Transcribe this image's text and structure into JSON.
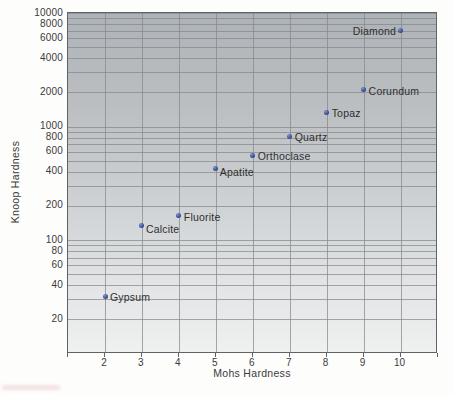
{
  "chart_data": {
    "type": "scatter",
    "title": "",
    "xlabel": "Mohs Hardness",
    "ylabel": "Knoop Hardness",
    "x_scale": "linear",
    "y_scale": "log",
    "xlim": [
      1,
      11
    ],
    "ylim": [
      10,
      10000
    ],
    "x_ticks": [
      2,
      3,
      4,
      5,
      6,
      7,
      8,
      9,
      10
    ],
    "y_tick_labels": [
      "10000",
      "8000",
      "6000",
      "4000",
      "2000",
      "1000",
      "800",
      "600",
      "400",
      "200",
      "100",
      "80",
      "60",
      "40",
      "20"
    ],
    "y_tick_values": [
      10000,
      8000,
      6000,
      4000,
      2000,
      1000,
      800,
      600,
      400,
      200,
      100,
      80,
      60,
      40,
      20
    ],
    "grid": "full log minor grid, vertical line each integer",
    "legend": "none",
    "points": [
      {
        "label": "Gypsum",
        "mohs": 2,
        "knoop": 32,
        "label_side": "right"
      },
      {
        "label": "Calcite",
        "mohs": 3,
        "knoop": 135,
        "label_side": "below-right"
      },
      {
        "label": "Fluorite",
        "mohs": 4,
        "knoop": 163,
        "label_side": "right"
      },
      {
        "label": "Apatite",
        "mohs": 5,
        "knoop": 430,
        "label_side": "below-right"
      },
      {
        "label": "Orthoclase",
        "mohs": 6,
        "knoop": 560,
        "label_side": "right"
      },
      {
        "label": "Quartz",
        "mohs": 7,
        "knoop": 820,
        "label_side": "right"
      },
      {
        "label": "Topaz",
        "mohs": 8,
        "knoop": 1340,
        "label_side": "right"
      },
      {
        "label": "Corundum",
        "mohs": 9,
        "knoop": 2100,
        "label_side": "right"
      },
      {
        "label": "Diamond",
        "mohs": 10,
        "knoop": 7000,
        "label_side": "left"
      }
    ],
    "colors": {
      "point": "#3c509c",
      "grid": "#84888c",
      "plot_bg_top": "#aeb3b7",
      "plot_bg_bottom": "#eff0f0",
      "border": "#5f6367",
      "text": "#3b3b3b",
      "page_bg": "#fdfdfc"
    }
  }
}
